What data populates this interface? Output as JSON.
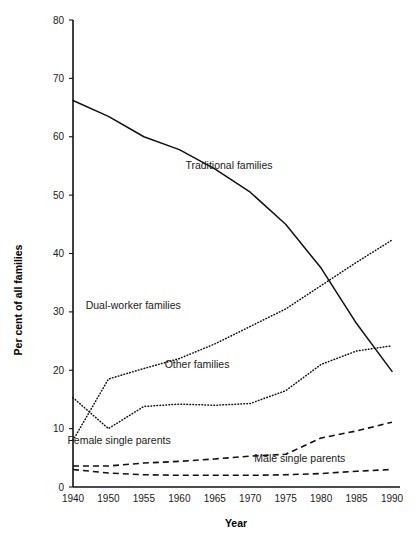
{
  "chart_data": {
    "type": "line",
    "title": "",
    "xlabel": "Year",
    "ylabel": "Per cent of all families",
    "xlim": [
      1940,
      1990
    ],
    "ylim": [
      0,
      80
    ],
    "grid": false,
    "legend": "inline-labels",
    "x_ticks": [
      "1940",
      "1950",
      "1955",
      "1960",
      "1965",
      "1970",
      "1975",
      "1980",
      "1985",
      "1990"
    ],
    "x_tick_values": [
      1940,
      1950,
      1955,
      1960,
      1965,
      1970,
      1975,
      1980,
      1985,
      1990
    ],
    "y_ticks": [
      "0",
      "10",
      "20",
      "30",
      "40",
      "50",
      "60",
      "70",
      "80"
    ],
    "y_tick_values": [
      0,
      10,
      20,
      30,
      40,
      50,
      60,
      70,
      80
    ],
    "x": [
      1940,
      1950,
      1955,
      1960,
      1965,
      1970,
      1975,
      1980,
      1985,
      1990
    ],
    "series": [
      {
        "name": "Traditional families",
        "style": "solid",
        "label_x": 1967,
        "label_y": 54.5,
        "values": [
          66.2,
          63.5,
          60.0,
          57.8,
          54.5,
          50.5,
          45.0,
          37.5,
          28.0,
          19.8
        ]
      },
      {
        "name": "Dual-worker families",
        "style": "dotted",
        "label_x": 1953.5,
        "label_y": 30.5,
        "values": [
          8.0,
          18.5,
          20.3,
          22.0,
          24.5,
          27.5,
          30.5,
          34.5,
          38.5,
          42.3
        ]
      },
      {
        "name": "Other families",
        "style": "dotted",
        "label_x": 1962.5,
        "label_y": 20.3,
        "values": [
          15.3,
          10.0,
          13.8,
          14.2,
          14.0,
          14.3,
          16.5,
          21.0,
          23.3,
          24.2
        ]
      },
      {
        "name": "Female single parents",
        "style": "dashed",
        "label_x": 1951.5,
        "label_y": 7.4,
        "values": [
          3.6,
          3.6,
          4.1,
          4.4,
          4.8,
          5.3,
          5.6,
          8.4,
          9.6,
          11.1
        ]
      },
      {
        "name": "Male single parents",
        "style": "dashed",
        "label_x": 1977.0,
        "label_y": 4.2,
        "values": [
          3.0,
          2.4,
          2.1,
          2.0,
          2.0,
          2.0,
          2.1,
          2.3,
          2.7,
          3.0
        ]
      }
    ]
  }
}
